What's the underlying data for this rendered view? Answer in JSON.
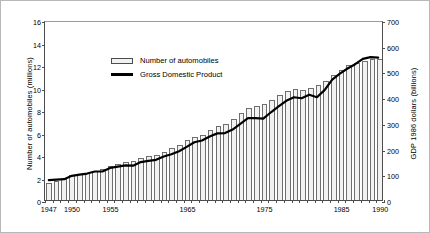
{
  "chart_data": {
    "type": "bar",
    "title": "",
    "xlabel": "",
    "ylabel": "Number of automobiles (millions)",
    "y2label": "GDP 1986 dollars (billions)",
    "grid": false,
    "legend_position": "upper-left-inside",
    "ylim": [
      0,
      16
    ],
    "y2lim": [
      0,
      700
    ],
    "yticks": [
      0,
      2,
      4,
      6,
      8,
      10,
      12,
      14,
      16
    ],
    "y2ticks": [
      0,
      100,
      200,
      300,
      400,
      500,
      600,
      700
    ],
    "xticks_labeled": [
      "1947",
      "1950",
      "1955",
      "1965",
      "1975",
      "1985",
      "1990"
    ],
    "xlim": [
      1947,
      1990
    ],
    "categories": [
      "1947",
      "1948",
      "1949",
      "1950",
      "1951",
      "1952",
      "1953",
      "1954",
      "1955",
      "1956",
      "1957",
      "1958",
      "1959",
      "1960",
      "1961",
      "1962",
      "1963",
      "1964",
      "1965",
      "1966",
      "1967",
      "1968",
      "1969",
      "1970",
      "1971",
      "1972",
      "1973",
      "1974",
      "1975",
      "1976",
      "1977",
      "1978",
      "1979",
      "1980",
      "1981",
      "1982",
      "1983",
      "1984",
      "1985",
      "1986",
      "1987",
      "1988",
      "1989",
      "1990"
    ],
    "series": [
      {
        "name": "Number of automobiles",
        "axis": "left",
        "unit": "millions",
        "type": "bar",
        "values": [
          1.5,
          1.7,
          1.9,
          2.2,
          2.3,
          2.4,
          2.6,
          2.8,
          3.0,
          3.2,
          3.4,
          3.5,
          3.7,
          3.9,
          4.0,
          4.3,
          4.6,
          4.9,
          5.3,
          5.6,
          5.8,
          6.2,
          6.6,
          6.8,
          7.2,
          7.7,
          8.2,
          8.4,
          8.5,
          8.9,
          9.3,
          9.7,
          9.9,
          9.8,
          10.0,
          10.2,
          10.6,
          11.1,
          11.6,
          12.0,
          12.2,
          12.4,
          12.5,
          12.5
        ]
      },
      {
        "name": "Gross Domestic Product",
        "axis": "right",
        "unit": "billions of 1986 dollars",
        "type": "line",
        "values": [
          78,
          80,
          82,
          95,
          100,
          104,
          112,
          112,
          126,
          131,
          136,
          135,
          149,
          154,
          158,
          171,
          180,
          192,
          209,
          227,
          234,
          250,
          262,
          263,
          277,
          299,
          322,
          322,
          320,
          345,
          368,
          390,
          404,
          400,
          414,
          404,
          432,
          473,
          497,
          517,
          534,
          555,
          562,
          560
        ]
      }
    ]
  },
  "legend": {
    "items": [
      {
        "label": "Number of automobiles",
        "swatch": "bar",
        "color": "#f2f2f2"
      },
      {
        "label": "Gross Domestic Product",
        "swatch": "line",
        "color": "#000000"
      }
    ]
  },
  "colors": {
    "bar_fill": "#f2f2f2",
    "bar_stroke": "#6e6e6e",
    "line": "#000000",
    "axis": "#4d4d4d",
    "frame": "#b8b8b8",
    "background": "#ffffff"
  }
}
